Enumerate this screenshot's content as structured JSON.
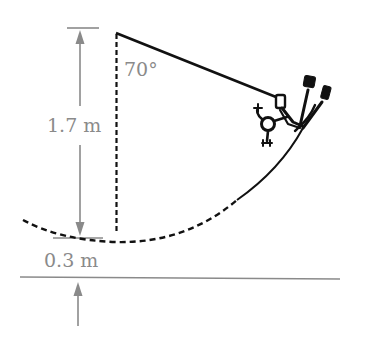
{
  "diagram": {
    "type": "physics-pendulum",
    "labels": {
      "height_upper": "1.7 m",
      "height_lower": "0.3 m",
      "angle": "70°"
    },
    "colors": {
      "line": "#111111",
      "dimension": "#8a8a8a",
      "text": "#8a8a8a"
    },
    "elements": {
      "pivot": {
        "x": 117,
        "y": 33
      },
      "climber": {
        "x": 290,
        "y": 100
      }
    }
  }
}
